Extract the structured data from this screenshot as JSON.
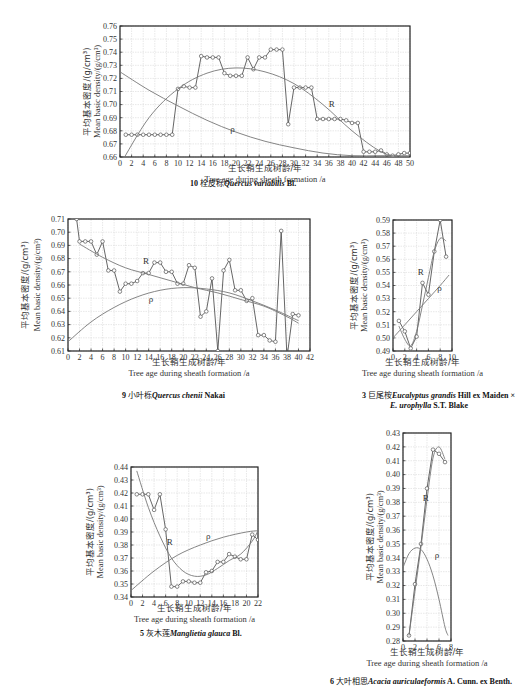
{
  "chart_data": [
    {
      "id": "chart-10",
      "type": "line",
      "caption": {
        "number": "10",
        "cn": "栓皮栎",
        "latin": "Quercus variabilis",
        "author": "Bl."
      },
      "ylabel_cn": "平均基本密度/(g/cm³)",
      "ylabel_en": "Mean basic density/(g/cm³)",
      "xlabel_cn": "生长鞘生成树龄/年",
      "xlabel_en": "Tree age during sheath formation /a",
      "xlim": [
        0,
        50
      ],
      "ylim": [
        0.66,
        0.76
      ],
      "xticks": [
        0,
        2,
        4,
        6,
        8,
        10,
        12,
        14,
        16,
        18,
        20,
        22,
        24,
        26,
        28,
        30,
        32,
        34,
        36,
        38,
        40,
        42,
        44,
        46,
        48,
        50
      ],
      "yticks": [
        0.66,
        0.67,
        0.68,
        0.69,
        0.7,
        0.71,
        0.72,
        0.73,
        0.74,
        0.75,
        0.76
      ],
      "grid": true,
      "series": [
        {
          "name": "observed",
          "x": [
            1,
            2,
            3,
            4,
            5,
            6,
            7,
            8,
            9,
            10,
            11,
            12,
            13,
            14,
            15,
            16,
            17,
            18,
            19,
            20,
            21,
            22,
            23,
            24,
            25,
            26,
            27,
            28,
            29,
            30,
            31,
            32,
            33,
            34,
            35,
            36,
            37,
            38,
            39,
            40,
            41,
            42,
            43,
            44,
            45,
            46,
            47,
            48,
            49,
            50
          ],
          "y": [
            0.677,
            0.677,
            0.677,
            0.677,
            0.677,
            0.677,
            0.677,
            0.677,
            0.677,
            0.712,
            0.714,
            0.713,
            0.713,
            0.737,
            0.736,
            0.736,
            0.736,
            0.724,
            0.722,
            0.722,
            0.722,
            0.736,
            0.727,
            0.736,
            0.736,
            0.742,
            0.742,
            0.742,
            0.685,
            0.713,
            0.713,
            0.713,
            0.713,
            0.689,
            0.689,
            0.689,
            0.689,
            0.689,
            0.688,
            0.686,
            0.686,
            0.664,
            0.664,
            0.664,
            0.665,
            0.662,
            0.661,
            0.662,
            0.663,
            0.663
          ]
        },
        {
          "name": "R",
          "label": "R",
          "x": [
            0,
            5,
            10,
            15,
            20,
            25,
            30,
            35,
            40,
            45,
            50
          ],
          "y": [
            0.654,
            0.69,
            0.712,
            0.724,
            0.728,
            0.725,
            0.716,
            0.7,
            0.68,
            0.664,
            0.656
          ]
        },
        {
          "name": "ρ",
          "label": "ρ",
          "x": [
            0,
            5,
            10,
            15,
            20,
            25,
            30,
            35,
            40,
            45,
            50
          ],
          "y": [
            0.725,
            0.711,
            0.699,
            0.688,
            0.679,
            0.672,
            0.667,
            0.663,
            0.661,
            0.661,
            0.661
          ]
        }
      ]
    },
    {
      "id": "chart-9",
      "type": "line",
      "caption": {
        "number": "9",
        "cn": "小叶栎",
        "latin": "Quercus chenii",
        "author": "Nakai"
      },
      "ylabel_cn": "平均基本密度/(g/cm³)",
      "ylabel_en": "Mean basic density/(g/cm³)",
      "xlabel_cn": "生长鞘生成树龄/年",
      "xlabel_en": "Tree age during sheath formation /a",
      "xlim": [
        0,
        42
      ],
      "ylim": [
        0.61,
        0.71
      ],
      "xticks": [
        0,
        2,
        4,
        6,
        8,
        10,
        12,
        14,
        16,
        18,
        20,
        22,
        24,
        26,
        28,
        30,
        32,
        34,
        36,
        38,
        40,
        42
      ],
      "yticks": [
        0.61,
        0.62,
        0.63,
        0.64,
        0.65,
        0.66,
        0.67,
        0.68,
        0.69,
        0.7,
        0.71
      ],
      "grid": true,
      "series": [
        {
          "name": "observed",
          "x": [
            1.5,
            2,
            3,
            4,
            5,
            6,
            7,
            8,
            9,
            10,
            11,
            12,
            13,
            14,
            15,
            16,
            17,
            18,
            19,
            20,
            21,
            22,
            23,
            24,
            25,
            26,
            27,
            28,
            29,
            30,
            31,
            32,
            33,
            34,
            35,
            36,
            37,
            38,
            39,
            40
          ],
          "y": [
            0.71,
            0.693,
            0.693,
            0.693,
            0.683,
            0.693,
            0.671,
            0.671,
            0.655,
            0.661,
            0.661,
            0.663,
            0.669,
            0.669,
            0.677,
            0.677,
            0.67,
            0.67,
            0.661,
            0.661,
            0.675,
            0.673,
            0.636,
            0.64,
            0.665,
            0.61,
            0.671,
            0.679,
            0.656,
            0.656,
            0.648,
            0.65,
            0.622,
            0.622,
            0.618,
            0.617,
            0.701,
            0.605,
            0.638,
            0.637
          ]
        },
        {
          "name": "R",
          "label": "R",
          "x": [
            2,
            6,
            10,
            14,
            18,
            22,
            26,
            30,
            34,
            38,
            40
          ],
          "y": [
            0.691,
            0.681,
            0.673,
            0.668,
            0.663,
            0.658,
            0.654,
            0.649,
            0.644,
            0.636,
            0.631
          ]
        },
        {
          "name": "ρ",
          "label": "ρ",
          "x": [
            0,
            4,
            8,
            12,
            16,
            20,
            24,
            28,
            32,
            36,
            40
          ],
          "y": [
            0.617,
            0.632,
            0.643,
            0.651,
            0.656,
            0.658,
            0.657,
            0.654,
            0.648,
            0.641,
            0.633
          ]
        }
      ]
    },
    {
      "id": "chart-3",
      "type": "line",
      "caption": {
        "number": "3",
        "cn": "巨尾桉",
        "latin": "Eucalyptus grandis",
        "author": "Hill ex Maiden ×",
        "latin2": "E. urophylla",
        "author2": "S.T. Blake"
      },
      "ylabel_cn": "平均基本密度/(g/cm³)",
      "ylabel_en": "Mean basic density/(g/cm³)",
      "xlabel_cn": "生长鞘生成树龄/年",
      "xlabel_en": "Tree age during sheath formation /a",
      "xlim": [
        0,
        10
      ],
      "ylim": [
        0.49,
        0.59
      ],
      "xticks": [
        0,
        2,
        4,
        6,
        8,
        10
      ],
      "yticks": [
        0.49,
        0.5,
        0.51,
        0.52,
        0.53,
        0.54,
        0.55,
        0.56,
        0.57,
        0.58,
        0.59
      ],
      "grid": true,
      "series": [
        {
          "name": "observed",
          "x": [
            1,
            2,
            3,
            4,
            5,
            6,
            7,
            8,
            9
          ],
          "y": [
            0.513,
            0.505,
            0.492,
            0.501,
            0.542,
            0.533,
            0.566,
            0.59,
            0.562
          ]
        },
        {
          "name": "R",
          "label": "R",
          "x": [
            1,
            2,
            3,
            4,
            5,
            6,
            7,
            8,
            9
          ],
          "y": [
            0.509,
            0.499,
            0.494,
            0.505,
            0.525,
            0.546,
            0.566,
            0.576,
            0.574
          ]
        },
        {
          "name": "ρ",
          "label": "ρ",
          "x": [
            0,
            2,
            4,
            6,
            8,
            9.5
          ],
          "y": [
            0.5,
            0.51,
            0.52,
            0.53,
            0.54,
            0.548
          ]
        }
      ]
    },
    {
      "id": "chart-5",
      "type": "line",
      "caption": {
        "number": "5",
        "cn": "灰木莲",
        "latin": "Manglietia glauca",
        "author": "Bl."
      },
      "ylabel_cn": "平均基本密度/(g/cm³)",
      "ylabel_en": "Mean basic density/(g/cm³)",
      "xlabel_cn": "生长鞘生成树龄/年",
      "xlabel_en": "Tree age during sheath formation /a",
      "xlim": [
        0,
        22
      ],
      "ylim": [
        0.34,
        0.44
      ],
      "xticks": [
        0,
        2,
        4,
        6,
        8,
        10,
        12,
        14,
        16,
        18,
        20,
        22
      ],
      "yticks": [
        0.34,
        0.35,
        0.36,
        0.37,
        0.38,
        0.39,
        0.4,
        0.41,
        0.42,
        0.43,
        0.44
      ],
      "grid": true,
      "series": [
        {
          "name": "observed",
          "x": [
            1,
            2,
            3,
            4,
            5,
            6,
            7,
            8,
            9,
            10,
            11,
            12,
            13,
            14,
            15,
            16,
            17,
            18,
            19,
            20,
            21,
            22
          ],
          "y": [
            0.419,
            0.419,
            0.419,
            0.407,
            0.419,
            0.392,
            0.348,
            0.348,
            0.352,
            0.352,
            0.351,
            0.351,
            0.359,
            0.36,
            0.367,
            0.367,
            0.373,
            0.371,
            0.369,
            0.369,
            0.388,
            0.384
          ]
        },
        {
          "name": "R",
          "label": "R",
          "x": [
            1,
            3,
            5,
            7,
            9,
            11,
            13,
            15,
            17,
            19,
            21,
            22
          ],
          "y": [
            0.437,
            0.409,
            0.387,
            0.37,
            0.36,
            0.356,
            0.357,
            0.362,
            0.368,
            0.373,
            0.383,
            0.391
          ]
        },
        {
          "name": "ρ",
          "label": "ρ",
          "x": [
            0,
            4,
            8,
            12,
            16,
            20,
            22
          ],
          "y": [
            0.345,
            0.36,
            0.372,
            0.38,
            0.386,
            0.39,
            0.391
          ]
        }
      ]
    },
    {
      "id": "chart-6",
      "type": "line",
      "caption": {
        "number": "6",
        "cn": "大叶相思",
        "latin": "Acacia auriculaeformis",
        "author": "A. Cunn. ex Benth."
      },
      "ylabel_cn": "平均基本密度/(g/cm³)",
      "ylabel_en": "Mean basic density/(g/cm³)",
      "xlabel_cn": "生长鞘生成树龄/年",
      "xlabel_en": "Tree age during sheath formation /a",
      "xlim": [
        0,
        8
      ],
      "ylim": [
        0.28,
        0.43
      ],
      "xticks": [
        0,
        2,
        4,
        6,
        8
      ],
      "yticks": [
        0.28,
        0.29,
        0.3,
        0.31,
        0.32,
        0.33,
        0.34,
        0.35,
        0.36,
        0.37,
        0.38,
        0.39,
        0.4,
        0.41,
        0.42,
        0.43
      ],
      "grid": true,
      "series": [
        {
          "name": "observed",
          "x": [
            1,
            2,
            3,
            4,
            5,
            6,
            7
          ],
          "y": [
            0.284,
            0.321,
            0.35,
            0.39,
            0.418,
            0.415,
            0.409
          ]
        },
        {
          "name": "R",
          "label": "R",
          "x": [
            1,
            2,
            3,
            4,
            5,
            6,
            7
          ],
          "y": [
            0.284,
            0.316,
            0.348,
            0.382,
            0.412,
            0.42,
            0.411
          ]
        },
        {
          "name": "ρ",
          "label": "ρ",
          "x": [
            0,
            1,
            2,
            3,
            4,
            5,
            6,
            7,
            7.5
          ],
          "y": [
            0.333,
            0.343,
            0.347,
            0.346,
            0.339,
            0.327,
            0.31,
            0.29,
            0.284
          ]
        }
      ]
    }
  ]
}
